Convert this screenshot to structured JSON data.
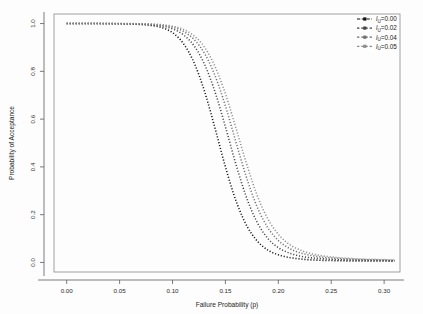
{
  "chart_data": {
    "type": "line",
    "title": "",
    "xlabel": "Failure Probability (p)",
    "ylabel": "Probability of Acceptance",
    "xlim": [
      -0.012,
      0.315
    ],
    "ylim": [
      -0.04,
      1.04
    ],
    "xticks": [
      "0.00",
      "0.05",
      "0.10",
      "0.15",
      "0.20",
      "0.25",
      "0.30"
    ],
    "xtick_values": [
      0.0,
      0.05,
      0.1,
      0.15,
      0.2,
      0.25,
      0.3
    ],
    "yticks": [
      "0.0",
      "0.2",
      "0.4",
      "0.6",
      "0.8",
      "1.0"
    ],
    "ytick_values": [
      0.0,
      0.2,
      0.4,
      0.6,
      0.8,
      1.0
    ],
    "grid": false,
    "legend_position": "top-right",
    "linestyle": "dotted",
    "x": [
      0.0,
      0.01,
      0.02,
      0.03,
      0.04,
      0.05,
      0.06,
      0.07,
      0.08,
      0.09,
      0.1,
      0.11,
      0.12,
      0.13,
      0.14,
      0.15,
      0.16,
      0.17,
      0.18,
      0.19,
      0.2,
      0.21,
      0.22,
      0.23,
      0.24,
      0.25,
      0.26,
      0.27,
      0.28,
      0.29,
      0.3,
      0.31
    ],
    "series": [
      {
        "name": "l_U=0.00",
        "label": "0.00",
        "color": "#111111",
        "midpoint": 0.143,
        "values": [
          1.0,
          1.0,
          1.0,
          1.0,
          0.999,
          0.999,
          0.998,
          0.996,
          0.992,
          0.983,
          0.962,
          0.918,
          0.84,
          0.72,
          0.565,
          0.4,
          0.258,
          0.155,
          0.09,
          0.052,
          0.032,
          0.021,
          0.015,
          0.011,
          0.009,
          0.008,
          0.007,
          0.006,
          0.006,
          0.006,
          0.006,
          0.005
        ]
      },
      {
        "name": "l_U=0.02",
        "label": "0.02",
        "color": "#444444",
        "midpoint": 0.155,
        "values": [
          1.0,
          1.0,
          1.0,
          1.0,
          1.0,
          0.999,
          0.999,
          0.998,
          0.995,
          0.99,
          0.978,
          0.954,
          0.909,
          0.832,
          0.716,
          0.568,
          0.41,
          0.271,
          0.168,
          0.101,
          0.062,
          0.04,
          0.027,
          0.02,
          0.016,
          0.013,
          0.011,
          0.01,
          0.009,
          0.008,
          0.008,
          0.007
        ]
      },
      {
        "name": "l_U=0.04",
        "label": "0.04",
        "color": "#6e6e6e",
        "midpoint": 0.163,
        "values": [
          1.0,
          1.0,
          1.0,
          1.0,
          1.0,
          1.0,
          0.999,
          0.999,
          0.997,
          0.993,
          0.985,
          0.968,
          0.935,
          0.877,
          0.784,
          0.655,
          0.503,
          0.355,
          0.232,
          0.146,
          0.092,
          0.06,
          0.041,
          0.03,
          0.023,
          0.019,
          0.016,
          0.014,
          0.012,
          0.011,
          0.01,
          0.009
        ]
      },
      {
        "name": "l_U=0.05",
        "label": "0.05",
        "color": "#8c8c8c",
        "midpoint": 0.168,
        "values": [
          1.0,
          1.0,
          1.0,
          1.0,
          1.0,
          1.0,
          1.0,
          0.999,
          0.998,
          0.995,
          0.989,
          0.976,
          0.95,
          0.903,
          0.822,
          0.706,
          0.562,
          0.413,
          0.281,
          0.183,
          0.118,
          0.077,
          0.053,
          0.038,
          0.029,
          0.023,
          0.019,
          0.016,
          0.014,
          0.013,
          0.012,
          0.011
        ]
      }
    ],
    "legend_entries": [
      {
        "symbol": "l",
        "subscript": "U",
        "value": "=0.00",
        "color": "#111111"
      },
      {
        "symbol": "l",
        "subscript": "U",
        "value": "=0.02",
        "color": "#444444"
      },
      {
        "symbol": "l",
        "subscript": "U",
        "value": "=0.04",
        "color": "#6e6e6e"
      },
      {
        "symbol": "l",
        "subscript": "U",
        "value": "=0.05",
        "color": "#8c8c8c"
      }
    ]
  }
}
